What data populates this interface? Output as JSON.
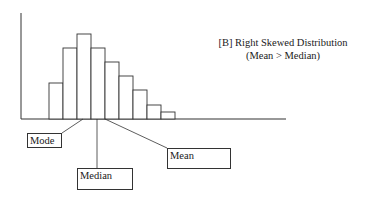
{
  "title": {
    "line1": "[B] Right Skewed Distribution",
    "line2": "(Mean > Median)"
  },
  "labels": {
    "mode": "Mode",
    "median": "Median",
    "mean": "Mean"
  },
  "colors": {
    "stroke": "#333333",
    "background": "#ffffff"
  },
  "chart_data": {
    "type": "bar",
    "title": "[B] Right Skewed Distribution (Mean > Median)",
    "categories": [
      "1",
      "2",
      "3",
      "4",
      "5",
      "6",
      "7",
      "8",
      "9"
    ],
    "values": [
      36,
      71,
      85,
      71,
      57,
      43,
      29,
      14,
      7
    ],
    "xlabel": "",
    "ylabel": "",
    "grid": false,
    "annotations": [
      {
        "text": "Mode",
        "points_to": "peak bar (bin 3)"
      },
      {
        "text": "Median",
        "points_to": "between bin 3 and bin 4"
      },
      {
        "text": "Mean",
        "points_to": "right of median, bin 4"
      }
    ]
  }
}
